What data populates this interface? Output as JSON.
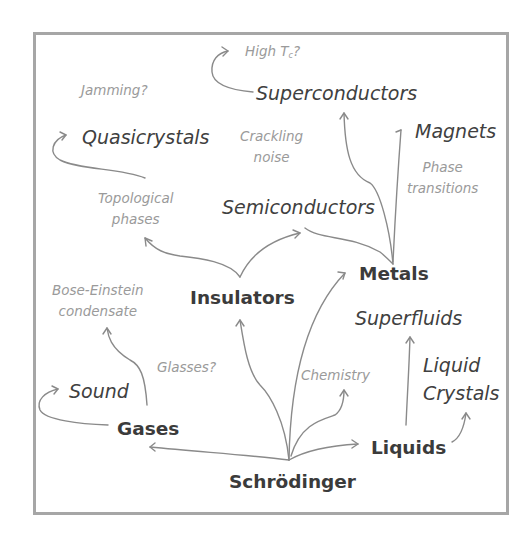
{
  "diagram": {
    "frame_color": "#a6a6a6",
    "arrow_color": "#8a8a8a",
    "root": {
      "label": "Schrödinger"
    },
    "primary_nodes": [
      {
        "id": "gases",
        "label": "Gases"
      },
      {
        "id": "liquids",
        "label": "Liquids"
      },
      {
        "id": "insulators",
        "label": "Insulators"
      },
      {
        "id": "metals",
        "label": "Metals"
      }
    ],
    "secondary_nodes": [
      {
        "id": "sound",
        "label": "Sound"
      },
      {
        "id": "superfluids",
        "label": "Superfluids"
      },
      {
        "id": "liquid_crystals",
        "lines": [
          "Liquid",
          "Crystals"
        ]
      },
      {
        "id": "semiconductors",
        "label": "Semiconductors"
      },
      {
        "id": "superconductors",
        "label": "Superconductors"
      },
      {
        "id": "magnets",
        "label": "Magnets"
      },
      {
        "id": "quasicrystals",
        "label": "Quasicrystals"
      }
    ],
    "annotations": [
      {
        "id": "high_tc",
        "label": "High T",
        "subscript": "c",
        "suffix": "?"
      },
      {
        "id": "jamming",
        "label": "Jamming?"
      },
      {
        "id": "crackling_noise",
        "lines": [
          "Crackling",
          "noise"
        ]
      },
      {
        "id": "phase_transitions",
        "lines": [
          "Phase",
          "transitions"
        ]
      },
      {
        "id": "topological_phases",
        "lines": [
          "Topological",
          "phases"
        ]
      },
      {
        "id": "bose_einstein",
        "lines": [
          "Bose-Einstein",
          "condensate"
        ]
      },
      {
        "id": "glasses",
        "label": "Glasses?"
      },
      {
        "id": "chemistry",
        "label": "Chemistry"
      }
    ],
    "edges": [
      {
        "from": "Schrödinger",
        "to": "Gases"
      },
      {
        "from": "Schrödinger",
        "to": "Liquids"
      },
      {
        "from": "Schrödinger",
        "to": "Insulators"
      },
      {
        "from": "Schrödinger",
        "to": "Metals"
      },
      {
        "from": "Schrödinger",
        "to": "Chemistry"
      },
      {
        "from": "Gases",
        "to": "Sound"
      },
      {
        "from": "Gases",
        "to": "Bose-Einstein condensate"
      },
      {
        "from": "Liquids",
        "to": "Superfluids"
      },
      {
        "from": "Liquids",
        "to": "Liquid Crystals"
      },
      {
        "from": "Insulators",
        "to": "Semiconductors"
      },
      {
        "from": "Insulators",
        "to": "Topological phases"
      },
      {
        "from": "Metals",
        "to": "Superconductors"
      },
      {
        "from": "Metals",
        "to": "Magnets"
      },
      {
        "from": "Topological phases",
        "to": "Quasicrystals"
      },
      {
        "from": "Superconductors",
        "to": "High Tc?"
      }
    ]
  }
}
